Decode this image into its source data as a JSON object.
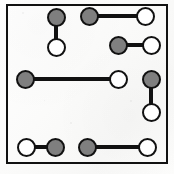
{
  "figure": {
    "background_color": "#fdfdfc",
    "stroke_color": "#111111",
    "gray_fill": "#7f7f7f",
    "white_fill": "#ffffff",
    "width": 174,
    "height": 174
  },
  "frame": {
    "label": "square-border",
    "x": 6,
    "y": 4,
    "width": 162,
    "height": 160,
    "border_width": 2
  },
  "node_style": {
    "diameter": 19,
    "border_width": 2
  },
  "edge_style": {
    "thickness": 4
  },
  "chart_data": {
    "type": "diagram",
    "xlabel": "",
    "ylabel": "",
    "xlim": [
      0,
      174
    ],
    "ylim": [
      0,
      174
    ],
    "grid": false,
    "legend": "none",
    "counts": {
      "pairs": 6,
      "vertical_pairs": 2,
      "horizontal_pairs": 4,
      "gray_nodes": 6,
      "white_nodes": 6,
      "total_nodes": 12
    },
    "pairs": [
      {
        "id": "pair-1",
        "orientation": "vertical",
        "length": 30,
        "nodes": [
          {
            "id": "n1",
            "fill": "gray",
            "cx": 56,
            "cy": 17
          },
          {
            "id": "n2",
            "fill": "white",
            "cx": 56,
            "cy": 47
          }
        ]
      },
      {
        "id": "pair-2",
        "orientation": "horizontal",
        "length": 56,
        "nodes": [
          {
            "id": "n3",
            "fill": "gray",
            "cx": 89,
            "cy": 16
          },
          {
            "id": "n4",
            "fill": "white",
            "cx": 145,
            "cy": 16
          }
        ]
      },
      {
        "id": "pair-3",
        "orientation": "horizontal",
        "length": 33,
        "nodes": [
          {
            "id": "n5",
            "fill": "gray",
            "cx": 118,
            "cy": 45
          },
          {
            "id": "n6",
            "fill": "white",
            "cx": 151,
            "cy": 45
          }
        ]
      },
      {
        "id": "pair-4",
        "orientation": "horizontal",
        "length": 93,
        "nodes": [
          {
            "id": "n7",
            "fill": "gray",
            "cx": 25,
            "cy": 79
          },
          {
            "id": "n8",
            "fill": "white",
            "cx": 118,
            "cy": 79
          }
        ]
      },
      {
        "id": "pair-5",
        "orientation": "vertical",
        "length": 33,
        "nodes": [
          {
            "id": "n9",
            "fill": "gray",
            "cx": 151,
            "cy": 79
          },
          {
            "id": "n10",
            "fill": "white",
            "cx": 151,
            "cy": 112
          }
        ]
      },
      {
        "id": "pair-6",
        "orientation": "horizontal",
        "length": 29,
        "nodes": [
          {
            "id": "n11",
            "fill": "white",
            "cx": 26,
            "cy": 147
          },
          {
            "id": "n12",
            "fill": "gray",
            "cx": 55,
            "cy": 147
          }
        ]
      },
      {
        "id": "pair-7",
        "orientation": "horizontal",
        "length": 60,
        "nodes": [
          {
            "id": "n13",
            "fill": "gray",
            "cx": 87,
            "cy": 147
          },
          {
            "id": "n14",
            "fill": "white",
            "cx": 147,
            "cy": 147
          }
        ]
      }
    ]
  }
}
